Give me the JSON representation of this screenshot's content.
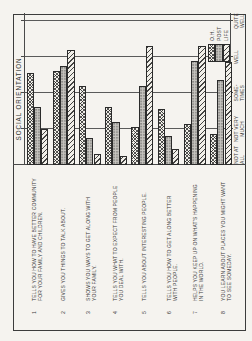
{
  "page": {
    "title": "SOCIAL ORIENTATION"
  },
  "survey_items": [
    {
      "num": "1",
      "lines": [
        "TELLS YOU HOW TO HAVE BETTER COMMUNITY",
        "FOR YOUR FAMILY AND CHILDREN."
      ]
    },
    {
      "num": "2",
      "lines": [
        "GIVES YOU THINGS TO TALK ABOUT."
      ]
    },
    {
      "num": "3",
      "lines": [
        "SHOWS YOU WAYS TO GET ALONG WITH",
        "YOUR FAMILY."
      ]
    },
    {
      "num": "4",
      "lines": [
        "TELLS YOU WHAT TO EXPECT FROM PEOPLE",
        "YOU DEAL WITH."
      ]
    },
    {
      "num": "5",
      "lines": [
        "TELLS YOU ABOUT INTERESTING PEOPLE."
      ]
    },
    {
      "num": "6",
      "lines": [
        "TELLS YOU HOW TO GET ALONG BETTER",
        "WITH PEOPLE."
      ]
    },
    {
      "num": "7",
      "lines": [
        "HELPS YOU KEEP UP ON WHAT'S HAPPENING",
        "IN THE WORLD."
      ]
    },
    {
      "num": "8",
      "lines": [
        "YOU LEARN ABOUT PLACES YOU MIGHT WANT",
        "TO SEE SOMEDAY."
      ]
    }
  ],
  "axis": {
    "scale_labels": [
      {
        "lines": [
          "NOT AT",
          "ALL"
        ]
      },
      {
        "lines": [
          "NOT VERY",
          "MUCH"
        ]
      },
      {
        "lines": [
          "SOME-",
          "TIMES"
        ]
      },
      {
        "lines": [
          "WELL"
        ]
      },
      {
        "lines": [
          "QUITE",
          "WELL"
        ]
      }
    ]
  },
  "legend": {
    "entries": [
      {
        "label": "O.H.",
        "pattern": "crosshatch"
      },
      {
        "label": "POST",
        "pattern": "stipple-gray"
      },
      {
        "label": "LIFE",
        "pattern": "diagonal-stripes"
      }
    ]
  },
  "colors": {
    "paper": "#f5f3ef",
    "ink": "#3b3b3b",
    "post_gray": "#c8c6c1"
  },
  "chart_data": {
    "type": "bar",
    "orientation": "horizontal",
    "rotation_in_screenshot_deg": -90,
    "title": "SOCIAL ORIENTATION",
    "categories": [
      "TELLS YOU HOW TO HAVE BETTER COMMUNITY FOR YOUR FAMILY AND CHILDREN.",
      "GIVES YOU THINGS TO TALK ABOUT.",
      "SHOWS YOU WAYS TO GET ALONG WITH YOUR FAMILY.",
      "TELLS YOU WHAT TO EXPECT FROM PEOPLE YOU DEAL WITH.",
      "TELLS YOU ABOUT INTERESTING PEOPLE.",
      "TELLS YOU HOW TO GET ALONG BETTER WITH PEOPLE.",
      "HELPS YOU KEEP UP ON WHAT'S HAPPENING IN THE WORLD.",
      "YOU LEARN ABOUT PLACES YOU MIGHT WANT TO SEE SOMEDAY."
    ],
    "series": [
      {
        "name": "O.H.",
        "values": [
          2.55,
          2.6,
          2.2,
          1.6,
          1.05,
          1.55,
          1.15,
          0.85
        ]
      },
      {
        "name": "POST",
        "values": [
          1.6,
          2.75,
          0.75,
          1.2,
          2.2,
          0.8,
          2.9,
          2.35
        ]
      },
      {
        "name": "LIFE",
        "values": [
          1.0,
          3.2,
          0.3,
          0.25,
          3.3,
          0.45,
          3.3,
          2.85
        ]
      }
    ],
    "x_scale_labels": [
      "NOT AT ALL",
      "NOT VERY MUCH",
      "SOMETIMES",
      "WELL",
      "QUITE WELL"
    ],
    "x_scale_values": [
      0,
      1,
      2,
      3,
      4
    ],
    "xlim": [
      0,
      4
    ],
    "grid": true,
    "legend_position": "bottom-right"
  }
}
